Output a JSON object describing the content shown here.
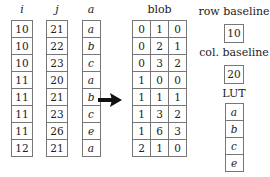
{
  "columns": [
    {
      "header": "i",
      "values": [
        "10",
        "10",
        "10",
        "11",
        "11",
        "11",
        "11",
        "12"
      ]
    },
    {
      "header": "j",
      "values": [
        "21",
        "22",
        "23",
        "20",
        "21",
        "23",
        "26",
        "21"
      ]
    },
    {
      "header": "a",
      "values": [
        "a",
        "b",
        "c",
        "a",
        "b",
        "c",
        "e",
        "a"
      ]
    }
  ],
  "arrow": {
    "icon": "right-arrow-icon"
  },
  "blob": {
    "header": "blob",
    "rows": [
      [
        "0",
        "1",
        "0"
      ],
      [
        "0",
        "2",
        "1"
      ],
      [
        "0",
        "3",
        "2"
      ],
      [
        "1",
        "0",
        "0"
      ],
      [
        "1",
        "1",
        "1"
      ],
      [
        "1",
        "3",
        "2"
      ],
      [
        "1",
        "6",
        "3"
      ],
      [
        "2",
        "1",
        "0"
      ]
    ]
  },
  "row_baseline": {
    "label": "row baseline",
    "value": "10"
  },
  "col_baseline": {
    "label": "col. baseline",
    "value": "20"
  },
  "lut": {
    "label": "LUT",
    "values": [
      "a",
      "b",
      "c",
      "e"
    ]
  }
}
